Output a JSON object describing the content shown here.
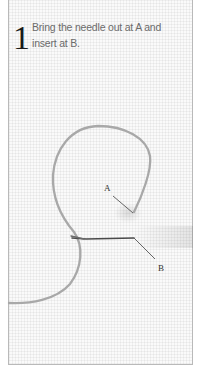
{
  "step": {
    "number": "1",
    "instruction": "Bring the needle out at A and insert at B."
  },
  "illustration": {
    "label_a": "A",
    "label_b": "B",
    "thread_color": "#a8a8a8",
    "stitch_color": "#4a4a4a",
    "background_color": "#fafafa",
    "frame_color": "#b9b9b9"
  }
}
